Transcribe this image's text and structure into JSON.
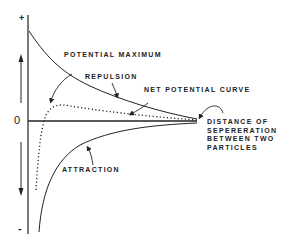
{
  "diagram": {
    "axis": {
      "plus_label": "+",
      "zero_label": "0",
      "minus_label": "-"
    },
    "labels": {
      "potential_maximum": "POTENTIAL MAXIMUM",
      "repulsion": "REPULSION",
      "net_potential_curve": "NET POTENTIAL CURVE",
      "attraction": "ATTRACTION",
      "distance_line1": "DISTANCE OF",
      "distance_line2": "SEPERERATION",
      "distance_line3": "BETWEEN TWO",
      "distance_line4": "PARTICLES"
    },
    "curves": [
      {
        "name": "repulsion",
        "style": "solid"
      },
      {
        "name": "attraction",
        "style": "solid"
      },
      {
        "name": "net potential",
        "style": "dotted"
      }
    ],
    "colors": {
      "ink": "#222222",
      "background": "#ffffff"
    }
  }
}
